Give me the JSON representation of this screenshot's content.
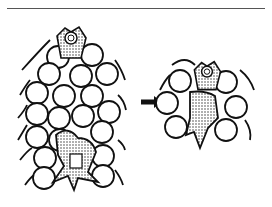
{
  "figure": {
    "left_panel": {
      "label": "before",
      "stroke_color": "#111111",
      "fill_color": "#ffffff",
      "circles": [
        [
          58,
          57
        ],
        [
          92,
          55
        ],
        [
          49,
          74
        ],
        [
          81,
          76
        ],
        [
          107,
          74
        ],
        [
          37,
          93
        ],
        [
          64,
          96
        ],
        [
          92,
          96
        ],
        [
          109,
          112
        ],
        [
          37,
          114
        ],
        [
          59,
          118
        ],
        [
          83,
          116
        ],
        [
          102,
          132
        ],
        [
          37,
          137
        ],
        [
          60,
          140
        ],
        [
          45,
          158
        ],
        [
          103,
          156
        ],
        [
          103,
          176
        ],
        [
          44,
          178
        ]
      ],
      "migrating_cell_top": {
        "cx": 71,
        "cy": 44
      },
      "migrating_cell_bottom": {
        "cx": 78,
        "cy": 160
      }
    },
    "arrow": {
      "direction": "right",
      "x1": 141,
      "x2": 162,
      "y": 102
    },
    "right_panel": {
      "label": "after",
      "circles": [
        [
          180,
          81
        ],
        [
          167,
          103
        ],
        [
          176,
          127
        ],
        [
          226,
          82
        ],
        [
          236,
          107
        ],
        [
          226,
          130
        ]
      ],
      "migrating_cell": {
        "cx": 207,
        "cy": 77
      }
    }
  }
}
